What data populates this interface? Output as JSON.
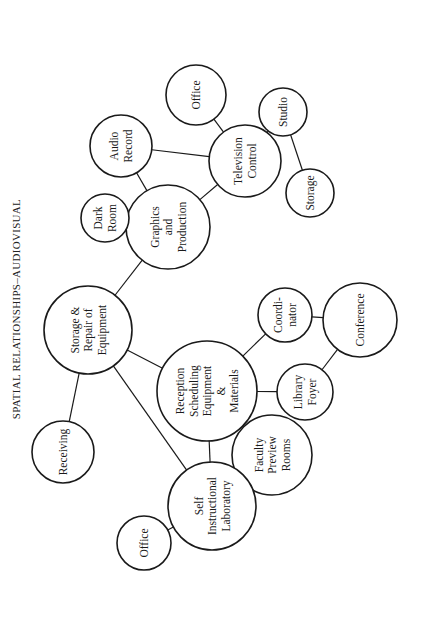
{
  "title": "SPATIAL RELATIONSHIPS–AUDIOVISUAL",
  "colors": {
    "stroke": "#1a1a1a",
    "background": "#ffffff"
  },
  "nodes": [
    {
      "id": "receiving",
      "lines": [
        "Receiving"
      ],
      "cx": 63,
      "cy": 452,
      "r": 31
    },
    {
      "id": "storage-repair",
      "lines": [
        "Storage &",
        "Repair of",
        "Equipment"
      ],
      "cx": 88,
      "cy": 330,
      "r": 44
    },
    {
      "id": "graphics-production",
      "lines": [
        "Graphics",
        "and",
        "Production"
      ],
      "cx": 168,
      "cy": 227,
      "r": 42
    },
    {
      "id": "dark-room",
      "lines": [
        "Dark",
        "Room"
      ],
      "cx": 105,
      "cy": 218,
      "r": 24
    },
    {
      "id": "audio-record",
      "lines": [
        "Audio",
        "Record"
      ],
      "cx": 121,
      "cy": 146,
      "r": 31
    },
    {
      "id": "television-control",
      "lines": [
        "Television",
        "Control"
      ],
      "cx": 245,
      "cy": 161,
      "r": 36
    },
    {
      "id": "office-top",
      "lines": [
        "Office"
      ],
      "cx": 196,
      "cy": 95,
      "r": 30
    },
    {
      "id": "studio",
      "lines": [
        "Studio"
      ],
      "cx": 283,
      "cy": 112,
      "r": 24
    },
    {
      "id": "storage",
      "lines": [
        "Storage"
      ],
      "cx": 310,
      "cy": 193,
      "r": 24
    },
    {
      "id": "reception",
      "lines": [
        "Reception",
        "Scheduling",
        "Equipment",
        "&",
        "Materials"
      ],
      "cx": 207,
      "cy": 391,
      "r": 50
    },
    {
      "id": "coordinator",
      "lines": [
        "Coordi-",
        "nator"
      ],
      "cx": 285,
      "cy": 315,
      "r": 27
    },
    {
      "id": "conference",
      "lines": [
        "Conference"
      ],
      "cx": 360,
      "cy": 320,
      "r": 37
    },
    {
      "id": "library-foyer",
      "lines": [
        "Library",
        "Foyer"
      ],
      "cx": 305,
      "cy": 392,
      "r": 28
    },
    {
      "id": "faculty-preview",
      "lines": [
        "Faculty",
        "Preview",
        "Rooms"
      ],
      "cx": 272,
      "cy": 455,
      "r": 40
    },
    {
      "id": "self-instructional",
      "lines": [
        "Self",
        "Instructional",
        "Laboratory"
      ],
      "cx": 212,
      "cy": 506,
      "r": 44
    },
    {
      "id": "office-bottom",
      "lines": [
        "Office"
      ],
      "cx": 144,
      "cy": 543,
      "r": 27
    }
  ],
  "edges": [
    [
      "receiving",
      "storage-repair"
    ],
    [
      "storage-repair",
      "graphics-production"
    ],
    [
      "storage-repair",
      "reception"
    ],
    [
      "storage-repair",
      "self-instructional"
    ],
    [
      "graphics-production",
      "dark-room"
    ],
    [
      "graphics-production",
      "audio-record"
    ],
    [
      "graphics-production",
      "television-control"
    ],
    [
      "audio-record",
      "television-control"
    ],
    [
      "television-control",
      "office-top"
    ],
    [
      "television-control",
      "studio"
    ],
    [
      "studio",
      "storage"
    ],
    [
      "reception",
      "coordinator"
    ],
    [
      "reception",
      "library-foyer"
    ],
    [
      "reception",
      "faculty-preview"
    ],
    [
      "reception",
      "self-instructional"
    ],
    [
      "coordinator",
      "conference"
    ],
    [
      "library-foyer",
      "conference"
    ],
    [
      "self-instructional",
      "office-bottom"
    ]
  ]
}
